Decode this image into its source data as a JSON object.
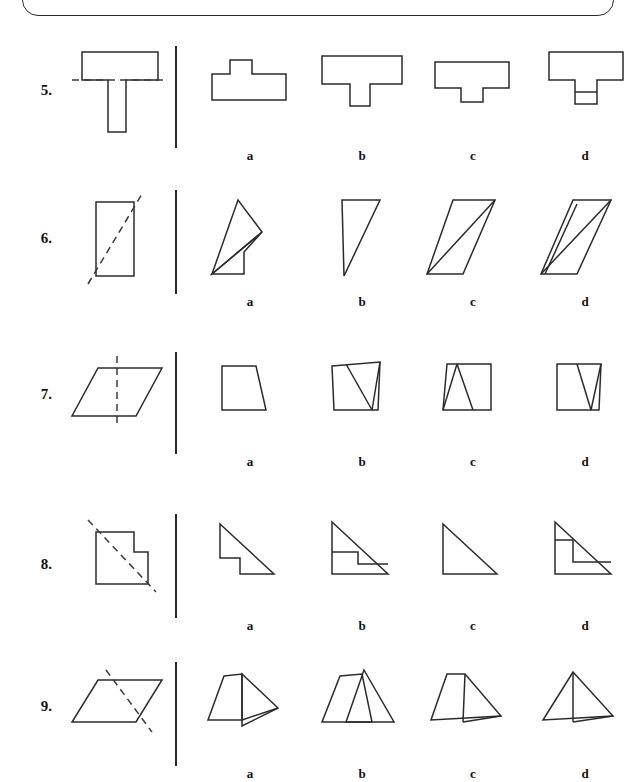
{
  "worksheet": {
    "title": "Fold-line symmetry multiple choice worksheet",
    "top_box_present": true,
    "option_letters": [
      "a",
      "b",
      "c",
      "d"
    ],
    "questions": [
      {
        "number": "5.",
        "prompt_shape": "t-shape-with-horizontal-dashed-fold-line",
        "fold_line": "horizontal",
        "options": [
          {
            "letter": "a",
            "shape": "rectangle-with-bump-on-top"
          },
          {
            "letter": "b",
            "shape": "wide-bar-with-tab-below"
          },
          {
            "letter": "c",
            "shape": "wide-bar-with-small-tab-below"
          },
          {
            "letter": "d",
            "shape": "t-shape-with-internal-horizontal-line"
          }
        ]
      },
      {
        "number": "6.",
        "prompt_shape": "vertical-rectangle-with-diagonal-dashed-fold-line",
        "fold_line": "diagonal",
        "options": [
          {
            "letter": "a",
            "shape": "rotated-quadrilateral-with-internal-line"
          },
          {
            "letter": "b",
            "shape": "right-triangle"
          },
          {
            "letter": "c",
            "shape": "slanted-shape-with-internal-diagonal"
          },
          {
            "letter": "d",
            "shape": "parallelogram-with-internal-diagonal"
          }
        ]
      },
      {
        "number": "7.",
        "prompt_shape": "parallelogram-with-vertical-dashed-fold-line",
        "fold_line": "vertical",
        "options": [
          {
            "letter": "a",
            "shape": "trapezoid"
          },
          {
            "letter": "b",
            "shape": "rectangle-with-internal-v"
          },
          {
            "letter": "c",
            "shape": "square-with-internal-triangle"
          },
          {
            "letter": "d",
            "shape": "square-with-v-notch"
          }
        ]
      },
      {
        "number": "8.",
        "prompt_shape": "notched-rectangle-with-diagonal-dashed-fold-line",
        "fold_line": "diagonal",
        "options": [
          {
            "letter": "a",
            "shape": "stepped-right-triangle"
          },
          {
            "letter": "b",
            "shape": "right-triangle-with-internal-step-lower"
          },
          {
            "letter": "c",
            "shape": "plain-right-triangle"
          },
          {
            "letter": "d",
            "shape": "right-triangle-with-internal-step-upper"
          }
        ]
      },
      {
        "number": "9.",
        "prompt_shape": "parallelogram-with-diagonal-dashed-fold-line",
        "fold_line": "diagonal",
        "options": [
          {
            "letter": "a",
            "shape": "quadrilateral-with-attached-triangle"
          },
          {
            "letter": "b",
            "shape": "two-overlapping-peaks"
          },
          {
            "letter": "c",
            "shape": "trapezoid-with-internal-divider-and-flap"
          },
          {
            "letter": "d",
            "shape": "triangle-with-internal-divider-and-flap"
          }
        ]
      }
    ]
  }
}
